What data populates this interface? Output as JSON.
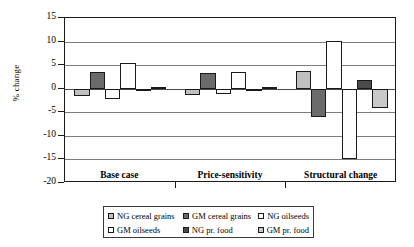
{
  "chart_data": {
    "type": "bar",
    "title": "",
    "xlabel": "",
    "ylabel": "% change",
    "ylim": [
      -20,
      15
    ],
    "ytick_step": 5,
    "yticks": [
      15,
      10,
      5,
      0,
      -5,
      -10,
      -15,
      -20
    ],
    "ytick_labels": [
      "15",
      "10",
      "5",
      "0",
      "-5",
      "-10",
      "-15",
      "-20"
    ],
    "grid": true,
    "grid_axis": "y",
    "legend_position": "bottom",
    "categories": [
      "Base case",
      "Price-sensitivity",
      "Structural change"
    ],
    "series": [
      {
        "name": "NG cereal grains",
        "color": "#bfbfbf",
        "values": [
          -1.5,
          -1.4,
          3.7
        ]
      },
      {
        "name": "GM cereal grains",
        "color": "#6b6b6b",
        "values": [
          3.5,
          3.4,
          -6.0
        ]
      },
      {
        "name": "NG oilseeds",
        "color": "#ffffff",
        "values": [
          -2.2,
          -1.2,
          10.1
        ]
      },
      {
        "name": "GM oilseeds",
        "color": "#fdfdfd",
        "values": [
          5.5,
          3.6,
          -15.0
        ]
      },
      {
        "name": "NG pr. food",
        "color": "#4a4a4a",
        "values": [
          -0.2,
          -0.2,
          1.8
        ]
      },
      {
        "name": "GM pr. food",
        "color": "#c9c9c9",
        "values": [
          0.4,
          0.3,
          -4.0
        ]
      }
    ]
  },
  "legend": {
    "rows": [
      [
        "NG cereal grains",
        "GM cereal grains",
        "NG oilseeds"
      ],
      [
        "GM oilseeds",
        "NG pr. food",
        "GM pr. food"
      ]
    ]
  }
}
